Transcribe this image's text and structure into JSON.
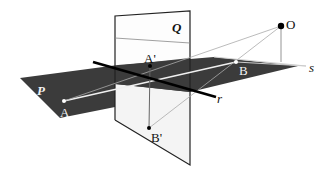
{
  "diagram": {
    "title": "",
    "planes": [
      {
        "id": "P",
        "label": "P",
        "fill": "#3a3a3a"
      },
      {
        "id": "Q",
        "label": "Q",
        "fill": "#ffffff"
      }
    ],
    "lines": [
      {
        "id": "r",
        "label": "r",
        "color": "#000000"
      },
      {
        "id": "s",
        "label": "s",
        "color": "#c8c8c8"
      }
    ],
    "points": [
      {
        "id": "A",
        "label": "A"
      },
      {
        "id": "B",
        "label": "B"
      },
      {
        "id": "A_prime",
        "label": "A'"
      },
      {
        "id": "B_prime",
        "label": "B'"
      },
      {
        "id": "O",
        "label": "O"
      }
    ]
  },
  "labels": {
    "P": "P",
    "Q": "Q",
    "r": "r",
    "s": "s",
    "A": "A",
    "B": "B",
    "A_prime": "A'",
    "B_prime": "B'",
    "O": "O"
  }
}
